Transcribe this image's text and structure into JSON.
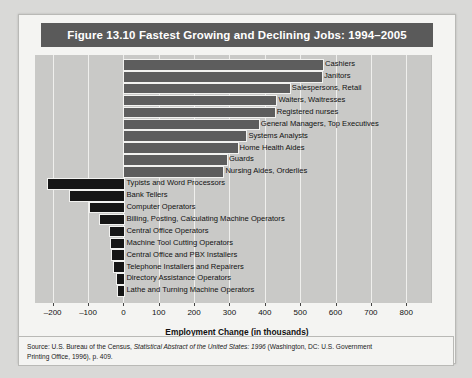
{
  "figure": {
    "title": "Figure 13.10  Fastest Growing and Declining Jobs: 1994–2005",
    "source_line1_a": "Source: U.S. Bureau of the Census, ",
    "source_line1_italic": "Statistical Abstract of the United States: 1996",
    "source_line1_b": " (Washington, DC: U.S. Government",
    "source_line2": "Printing Office, 1996), p. 409."
  },
  "colors": {
    "title_bar": "#5a5a5a",
    "title_text": "#ffffff",
    "plot_background": "#c9c9c7",
    "gridline": "#efefed",
    "growing_bar": "#5d5d5d",
    "declining_bar": "#161616",
    "card_background": "#f4f4f2",
    "page_background": "#d9d9d7"
  },
  "chart_data": {
    "type": "bar",
    "orientation": "horizontal",
    "title": "Figure 13.10  Fastest Growing and Declining Jobs: 1994–2005",
    "xlabel": "Employment Change (in thousands)",
    "ylabel": "",
    "xlim": [
      -250,
      870
    ],
    "xticks": [
      -200,
      -100,
      0,
      100,
      200,
      300,
      400,
      500,
      600,
      700,
      800
    ],
    "xticklabels": [
      "–200",
      "–100",
      "0",
      "100",
      "200",
      "300",
      "400",
      "500",
      "600",
      "700",
      "800"
    ],
    "grid": true,
    "legend": "none",
    "categories": [
      "Cashiers",
      "Janitors",
      "Salespersons, Retail",
      "Waiters, Waitresses",
      "Registered nurses",
      "General Managers, Top Executives",
      "Systems Analysts",
      "Home Health Aides",
      "Guards",
      "Nursing Aides, Orderlies",
      "Typists and Word Processors",
      "Bank Tellers",
      "Computer Operators",
      "Billing, Posting, Calculating Machine Operators",
      "Central Office Operators",
      "Machine Tool Cutting Operators",
      "Central Office and PBX Installers",
      "Telephone Installers and Repairers",
      "Directory Assistance Operators",
      "Lathe and Turning Machine Operators"
    ],
    "values": [
      562,
      559,
      468,
      430,
      425,
      380,
      345,
      320,
      290,
      280,
      -215,
      -155,
      -98,
      -68,
      -40,
      -38,
      -36,
      -30,
      -22,
      -18
    ],
    "groups": [
      {
        "name": "Fastest Growing",
        "indices": [
          0,
          1,
          2,
          3,
          4,
          5,
          6,
          7,
          8,
          9
        ]
      },
      {
        "name": "Fastest Declining",
        "indices": [
          10,
          11,
          12,
          13,
          14,
          15,
          16,
          17,
          18,
          19
        ]
      }
    ]
  }
}
